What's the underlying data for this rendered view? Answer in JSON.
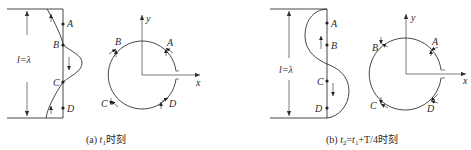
{
  "panels": [
    {
      "id": "a",
      "caption": {
        "prefix": "(a) ",
        "var": "t",
        "sub": "1",
        "suffix": "时刻"
      },
      "wave": {
        "dimension_label": "l=λ",
        "points": [
          "A",
          "B",
          "C",
          "D"
        ],
        "description": "wave displacement along string; arrows show velocity directions"
      },
      "phasor": {
        "axes": {
          "x": "x",
          "y": "y"
        },
        "points": [
          "A",
          "B",
          "C",
          "D"
        ]
      }
    },
    {
      "id": "b",
      "caption": {
        "prefix": "(b) ",
        "var": "t",
        "sub": "2",
        "eq": "=",
        "var2": "t",
        "sub2": "1",
        "tail": "+T/4",
        "suffix": "时刻"
      },
      "wave": {
        "dimension_label": "l=λ",
        "points": [
          "A",
          "B",
          "C",
          "D"
        ],
        "description": "wave a quarter period later"
      },
      "phasor": {
        "axes": {
          "x": "x",
          "y": "y"
        },
        "points": [
          "A",
          "B",
          "C",
          "D"
        ]
      }
    }
  ],
  "colors": {
    "ink": "#333333",
    "background": "#ffffff"
  }
}
